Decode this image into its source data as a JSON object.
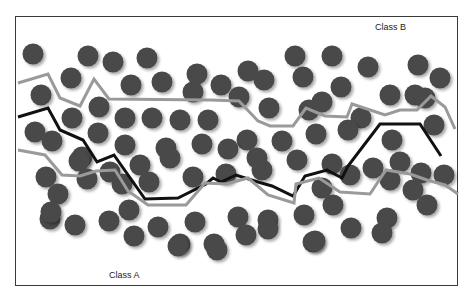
{
  "diagram": {
    "type": "classification-boundary-illustration",
    "labels": {
      "class_b": "Class B",
      "class_a": "Class A"
    },
    "colors": {
      "circle": "#4a4a4a",
      "circle_shadow": "#bdbdbd",
      "boundary_dark": "#111111",
      "boundary_light": "#9a9a9a",
      "frame": "#3a3a3a"
    },
    "circle_radius": 10.5,
    "circles": [
      [
        33,
        54
      ],
      [
        88,
        56
      ],
      [
        113,
        62
      ],
      [
        147,
        58
      ],
      [
        197,
        74
      ],
      [
        248,
        71
      ],
      [
        295,
        56
      ],
      [
        332,
        56
      ],
      [
        71,
        78
      ],
      [
        131,
        85
      ],
      [
        162,
        82
      ],
      [
        221,
        85
      ],
      [
        264,
        80
      ],
      [
        303,
        77
      ],
      [
        368,
        67
      ],
      [
        418,
        65
      ],
      [
        41,
        95
      ],
      [
        99,
        107
      ],
      [
        193,
        92
      ],
      [
        239,
        97
      ],
      [
        269,
        108
      ],
      [
        309,
        110
      ],
      [
        341,
        87
      ],
      [
        390,
        95
      ],
      [
        415,
        95
      ],
      [
        440,
        78
      ],
      [
        72,
        118
      ],
      [
        98,
        133
      ],
      [
        125,
        118
      ],
      [
        152,
        118
      ],
      [
        180,
        120
      ],
      [
        208,
        120
      ],
      [
        322,
        102
      ],
      [
        361,
        118
      ],
      [
        425,
        98
      ],
      [
        35,
        132
      ],
      [
        52,
        141
      ],
      [
        82,
        157
      ],
      [
        125,
        145
      ],
      [
        166,
        148
      ],
      [
        202,
        144
      ],
      [
        247,
        140
      ],
      [
        282,
        141
      ],
      [
        316,
        134
      ],
      [
        348,
        130
      ],
      [
        392,
        140
      ],
      [
        434,
        125
      ],
      [
        46,
        177
      ],
      [
        79,
        161
      ],
      [
        110,
        172
      ],
      [
        140,
        165
      ],
      [
        170,
        158
      ],
      [
        228,
        149
      ],
      [
        257,
        158
      ],
      [
        297,
        160
      ],
      [
        332,
        164
      ],
      [
        373,
        168
      ],
      [
        400,
        162
      ],
      [
        58,
        194
      ],
      [
        87,
        179
      ],
      [
        122,
        184
      ],
      [
        149,
        182
      ],
      [
        193,
        177
      ],
      [
        226,
        174
      ],
      [
        262,
        170
      ],
      [
        322,
        188
      ],
      [
        350,
        175
      ],
      [
        390,
        180
      ],
      [
        421,
        173
      ],
      [
        444,
        175
      ],
      [
        50,
        219
      ],
      [
        75,
        225
      ],
      [
        109,
        221
      ],
      [
        129,
        210
      ],
      [
        158,
        227
      ],
      [
        195,
        222
      ],
      [
        238,
        217
      ],
      [
        268,
        220
      ],
      [
        304,
        215
      ],
      [
        333,
        205
      ],
      [
        387,
        218
      ],
      [
        413,
        190
      ],
      [
        51,
        212
      ],
      [
        134,
        236
      ],
      [
        180,
        244
      ],
      [
        214,
        244
      ],
      [
        246,
        235
      ],
      [
        268,
        229
      ],
      [
        313,
        242
      ],
      [
        351,
        228
      ],
      [
        382,
        233
      ],
      [
        427,
        205
      ],
      [
        178,
        246
      ],
      [
        217,
        250
      ],
      [
        315,
        241
      ]
    ],
    "boundaries": [
      {
        "name": "upper-light-boundary",
        "stroke": "#9a9a9a",
        "width": 3,
        "points": [
          [
            18,
            83
          ],
          [
            48,
            74
          ],
          [
            60,
            98
          ],
          [
            80,
            106
          ],
          [
            94,
            79
          ],
          [
            109,
            99
          ],
          [
            210,
            100
          ],
          [
            239,
            101
          ],
          [
            258,
            121
          ],
          [
            270,
            126
          ],
          [
            293,
            126
          ],
          [
            306,
            108
          ],
          [
            325,
            116
          ],
          [
            347,
            117
          ],
          [
            352,
            104
          ],
          [
            385,
            115
          ],
          [
            400,
            110
          ],
          [
            417,
            110
          ],
          [
            431,
            96
          ],
          [
            445,
            107
          ],
          [
            455,
            129
          ]
        ]
      },
      {
        "name": "dark-decision-boundary",
        "stroke": "#111111",
        "width": 3,
        "points": [
          [
            18,
            117
          ],
          [
            48,
            108
          ],
          [
            60,
            130
          ],
          [
            83,
            140
          ],
          [
            97,
            162
          ],
          [
            114,
            155
          ],
          [
            145,
            199
          ],
          [
            178,
            198
          ],
          [
            206,
            184
          ],
          [
            213,
            178
          ],
          [
            221,
            182
          ],
          [
            236,
            175
          ],
          [
            258,
            182
          ],
          [
            272,
            186
          ],
          [
            293,
            196
          ],
          [
            305,
            176
          ],
          [
            327,
            170
          ],
          [
            342,
            178
          ],
          [
            348,
            166
          ],
          [
            380,
            124
          ],
          [
            420,
            124
          ],
          [
            441,
            156
          ]
        ]
      },
      {
        "name": "lower-light-boundary",
        "stroke": "#9a9a9a",
        "width": 3,
        "points": [
          [
            18,
            150
          ],
          [
            45,
            155
          ],
          [
            62,
            175
          ],
          [
            80,
            176
          ],
          [
            96,
            171
          ],
          [
            115,
            170
          ],
          [
            128,
            191
          ],
          [
            148,
            205
          ],
          [
            186,
            205
          ],
          [
            205,
            183
          ],
          [
            226,
            184
          ],
          [
            248,
            178
          ],
          [
            268,
            195
          ],
          [
            294,
            203
          ],
          [
            296,
            184
          ],
          [
            319,
            178
          ],
          [
            340,
            192
          ],
          [
            370,
            194
          ],
          [
            386,
            170
          ],
          [
            410,
            174
          ],
          [
            427,
            180
          ],
          [
            445,
            185
          ],
          [
            458,
            194
          ]
        ]
      }
    ]
  }
}
